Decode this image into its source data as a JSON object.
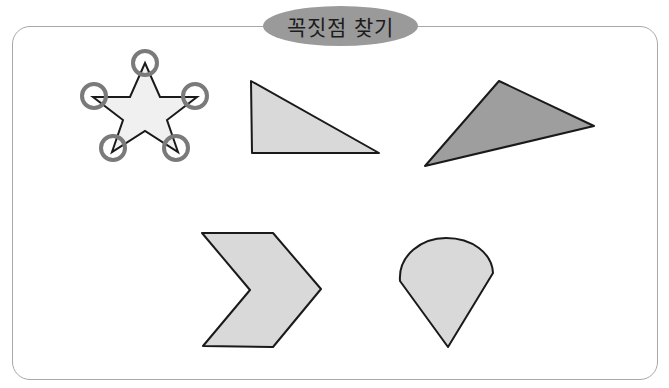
{
  "title": "꼭짓점 찾기",
  "colors": {
    "frame_border": "#a8a8a8",
    "title_pill": "#9a9a9a",
    "shape_light": "#d9d9d9",
    "shape_dark": "#9e9e9e",
    "star_fill": "#f0f0f0",
    "circle_marker": "#7a7a7a",
    "outline": "#1a1a1a"
  },
  "shapes": [
    {
      "name": "star",
      "vertices_circled": 5
    },
    {
      "name": "right-triangle"
    },
    {
      "name": "obtuse-triangle"
    },
    {
      "name": "chevron"
    },
    {
      "name": "teardrop"
    }
  ]
}
